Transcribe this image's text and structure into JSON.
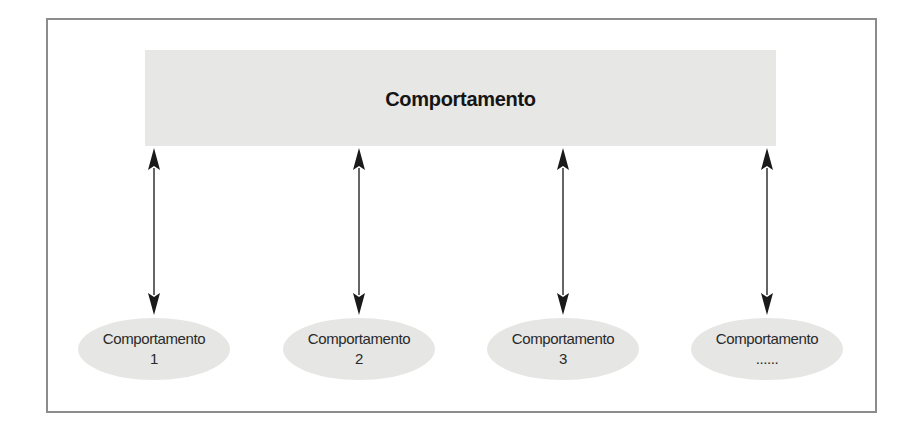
{
  "diagram": {
    "top": {
      "label": "Comportamento"
    },
    "nodes": [
      {
        "label": "Comportamento",
        "sub": "1",
        "cx": 154
      },
      {
        "label": "Comportamento",
        "sub": "2",
        "cx": 359
      },
      {
        "label": "Comportamento",
        "sub": "3",
        "cx": 563
      },
      {
        "label": "Comportamento",
        "sub": "......",
        "cx": 767
      }
    ],
    "connectors": [
      {
        "from": "top",
        "to": "node-1",
        "type": "bidirectional-arrow"
      },
      {
        "from": "top",
        "to": "node-2",
        "type": "bidirectional-arrow"
      },
      {
        "from": "top",
        "to": "node-3",
        "type": "bidirectional-arrow"
      },
      {
        "from": "top",
        "to": "node-4",
        "type": "bidirectional-arrow"
      }
    ],
    "colors": {
      "box_fill": "#e7e7e5",
      "node_fill": "#e6e6e4",
      "frame_border": "#8c8c8c",
      "arrow": "#1a1a1a"
    }
  }
}
